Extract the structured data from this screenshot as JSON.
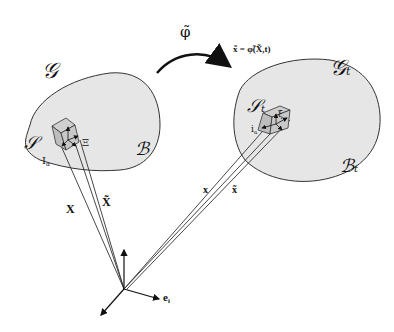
{
  "diagram": {
    "type": "continuum mechanics configuration mapping",
    "colors": {
      "body_fill": "#e6e6e6",
      "outline": "#333333",
      "ink": "#111111",
      "cube_fill": "#bdbdbd"
    },
    "mapping": {
      "symbol": "φ̃",
      "equation": "x̃ = φ̃(X̃,t)"
    },
    "reference": {
      "space_label": "𝒢",
      "body_label": "ℬ",
      "element_label": "𝒮",
      "director_label": "Ξ",
      "basis_label": "I",
      "basis_sub": "α",
      "position_label": "X",
      "position_tilde_label": "X̃"
    },
    "current": {
      "space_label": "𝒢",
      "space_sub": "t",
      "body_label": "ℬ",
      "body_sub": "t",
      "element_label": "𝒮",
      "element_sub": "t",
      "director_label": "ξ",
      "basis_label": "i",
      "basis_sub": "α",
      "position_label": "x",
      "position_tilde_label": "x̃"
    },
    "frame": {
      "basis_label": "e",
      "basis_sub": "i"
    }
  }
}
